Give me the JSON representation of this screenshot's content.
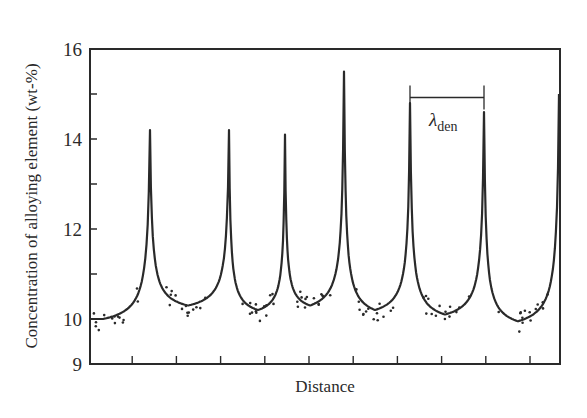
{
  "chart_data": {
    "type": "line",
    "title": "",
    "xlabel": "Distance",
    "ylabel": "Concentration of alloying element (wt-%)",
    "ylim": [
      9,
      16
    ],
    "xlim": [
      0,
      470
    ],
    "yticks": [
      9,
      10,
      11,
      12,
      13,
      14,
      15,
      16
    ],
    "ytick_labels": [
      "9",
      "10",
      "12",
      "14",
      "16"
    ],
    "ytick_labeled_values": [
      9,
      10,
      12,
      14,
      16
    ],
    "xtick_count": 10,
    "xtick_labels": [],
    "grid": false,
    "legend": null,
    "annotations": [
      {
        "text": "λ",
        "subscript": "den",
        "meaning": "dendrite arm spacing",
        "x_start": 320,
        "x_end": 394,
        "y_value": 14.9
      }
    ],
    "series": [
      {
        "name": "fitted profile",
        "style": "solid line",
        "peaks": [
          {
            "x": 60,
            "y": 14.2
          },
          {
            "x": 139,
            "y": 14.2
          },
          {
            "x": 195,
            "y": 14.1
          },
          {
            "x": 254,
            "y": 15.5
          },
          {
            "x": 320,
            "y": 14.8
          },
          {
            "x": 394,
            "y": 14.6
          },
          {
            "x": 469,
            "y": 15.0
          }
        ],
        "valleys": [
          {
            "x": 13,
            "y": 10.0
          },
          {
            "x": 98,
            "y": 10.3
          },
          {
            "x": 168,
            "y": 10.2
          },
          {
            "x": 220,
            "y": 10.3
          },
          {
            "x": 285,
            "y": 10.2
          },
          {
            "x": 355,
            "y": 10.1
          },
          {
            "x": 428,
            "y": 9.95
          }
        ]
      },
      {
        "name": "measured points",
        "style": "scatter dots",
        "note": "scattered measurements around the fitted curve near each valley, roughly 9.7–10.9 wt-%"
      }
    ]
  },
  "colors": {
    "ink": "#2a2a2a",
    "background": "#ffffff"
  }
}
